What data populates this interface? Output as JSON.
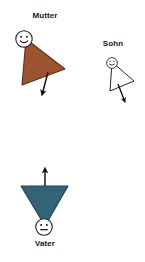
{
  "diagram": {
    "kind": "family-constellation-diagram",
    "background_color": "#ffffff",
    "language": "de",
    "figures": [
      {
        "id": "mutter",
        "label": "Mutter",
        "role": "mother",
        "shape": "triangle",
        "shape_orientation": "point-right",
        "fill_color": "#9c5430",
        "stroke_color": "#5d3118",
        "filled": true,
        "face": {
          "expression": "smile",
          "fill_color": "#ffffff",
          "stroke_color": "#1a1a1a",
          "eyes": 2
        },
        "arrow": {
          "direction": "down-left",
          "color": "#141414"
        }
      },
      {
        "id": "sohn",
        "label": "Sohn",
        "role": "son",
        "shape": "triangle",
        "shape_orientation": "point-right",
        "fill_color": "#ffffff",
        "stroke_color": "#1a1a1a",
        "filled": false,
        "face": {
          "expression": "smile",
          "fill_color": "#ffffff",
          "stroke_color": "#1a1a1a",
          "eyes": 2
        },
        "arrow": {
          "direction": "down-right",
          "color": "#141414"
        }
      },
      {
        "id": "vater",
        "label": "Vater",
        "role": "father",
        "shape": "triangle",
        "shape_orientation": "point-down",
        "fill_color": "#336377",
        "stroke_color": "#20434f",
        "filled": true,
        "face": {
          "expression": "neutral",
          "fill_color": "#ffffff",
          "stroke_color": "#1a1a1a",
          "eyes": 2
        },
        "arrow": {
          "direction": "up",
          "color": "#141414"
        }
      }
    ]
  }
}
